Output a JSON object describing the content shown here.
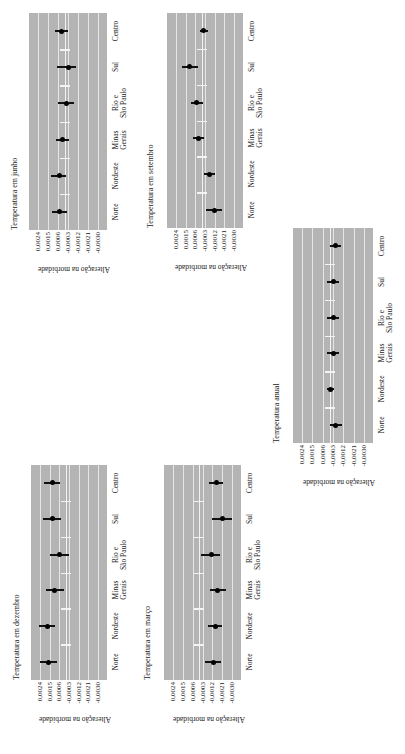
{
  "figure": {
    "categories": [
      "Norte",
      "Nordeste",
      "Minas Gerais",
      "Rio e São Paulo",
      "Sul",
      "Centro"
    ],
    "category_lines": [
      [
        "Norte"
      ],
      [
        "Nordeste"
      ],
      [
        "Minas",
        "Gerais"
      ],
      [
        "Rio e",
        "São Paulo"
      ],
      [
        "Sul"
      ],
      [
        "Centro"
      ]
    ],
    "tick_labels": [
      "0,0024",
      "0,0015",
      "0,0006",
      "-0,0003",
      "-0,0012",
      "-0,0021",
      "-0,0030"
    ],
    "ylabel": "Alteração na morbidade",
    "colors": {
      "plot_bg": "#b4b4b4",
      "grid": "#e6e6e6",
      "marker": "#000000"
    }
  },
  "chart_data": [
    {
      "type": "scatter",
      "title": "Temperatura em junho",
      "xlabel": "",
      "ylabel": "Alteração na morbidade",
      "categories": [
        "Norte",
        "Nordeste",
        "Minas Gerais",
        "Rio e São Paulo",
        "Sul",
        "Centro"
      ],
      "values": [
        0.0005,
        0.0005,
        0.0002,
        -0.0002,
        -0.0003,
        0.0003
      ],
      "ci_low": [
        -0.0002,
        -0.0001,
        -0.0004,
        -0.0008,
        -0.001,
        -0.0003
      ],
      "ci_high": [
        0.0011,
        0.0012,
        0.0008,
        0.0006,
        0.0007,
        0.0009
      ],
      "ylim": [
        -0.003,
        0.0024
      ],
      "grid": true
    },
    {
      "type": "scatter",
      "title": "Temperatura em setembro",
      "xlabel": "",
      "ylabel": "Alteração na morbidade",
      "categories": [
        "Norte",
        "Nordeste",
        "Minas Gerais",
        "Rio e São Paulo",
        "Sul",
        "Centro"
      ],
      "values": [
        -0.0012,
        -0.0007,
        0.0003,
        0.0005,
        0.0011,
        -0.0002
      ],
      "ci_low": [
        -0.0019,
        -0.0012,
        -0.0002,
        -0.0001,
        0.0003,
        -0.0006
      ],
      "ci_high": [
        -0.0004,
        -0.0002,
        0.0008,
        0.001,
        0.0018,
        0.0002
      ],
      "ylim": [
        -0.003,
        0.0024
      ],
      "grid": true
    },
    {
      "type": "scatter",
      "title": "Temperatura em dezembro",
      "xlabel": "",
      "ylabel": "Alteração na morbidade",
      "categories": [
        "Norte",
        "Nordeste",
        "Minas Gerais",
        "Rio e São Paulo",
        "Sul",
        "Centro"
      ],
      "values": [
        0.0016,
        0.0017,
        0.001,
        0.0006,
        0.0012,
        0.0012
      ],
      "ci_low": [
        0.0008,
        0.001,
        0.0002,
        -0.0003,
        0.0004,
        0.0005
      ],
      "ci_high": [
        0.0024,
        0.0025,
        0.0018,
        0.0015,
        0.0021,
        0.002
      ],
      "ylim": [
        -0.003,
        0.0024
      ],
      "grid": true
    },
    {
      "type": "scatter",
      "title": "Temperatura em março",
      "xlabel": "",
      "ylabel": "Alteração na morbidade",
      "categories": [
        "Norte",
        "Nordeste",
        "Minas Gerais",
        "Rio e São Paulo",
        "Sul",
        "Centro"
      ],
      "values": [
        -0.0013,
        -0.0015,
        -0.0017,
        -0.0011,
        -0.0021,
        -0.0016
      ],
      "ci_low": [
        -0.002,
        -0.0021,
        -0.0024,
        -0.0019,
        -0.003,
        -0.0022
      ],
      "ci_high": [
        -0.0005,
        -0.0008,
        -0.001,
        -0.0002,
        -0.0012,
        -0.0009
      ],
      "ylim": [
        -0.003,
        0.0024
      ],
      "grid": true
    },
    {
      "type": "scatter",
      "title": "Temperatura anual",
      "xlabel": "",
      "ylabel": "Alteração na morbidade",
      "categories": [
        "Norte",
        "Nordeste",
        "Minas Gerais",
        "Rio e São Paulo",
        "Sul",
        "Centro"
      ],
      "values": [
        -0.0005,
        -0.0001,
        -0.0003,
        -0.0003,
        -0.0003,
        -0.0005
      ],
      "ci_low": [
        -0.0011,
        -0.0004,
        -0.0008,
        -0.0008,
        -0.0008,
        -0.001
      ],
      "ci_high": [
        0.0,
        0.0002,
        0.0002,
        0.0002,
        0.0002,
        0.0
      ],
      "ylim": [
        -0.003,
        0.0024
      ],
      "grid": true
    }
  ],
  "layout": [
    {
      "plot": [
        29,
        13,
        78,
        217
      ],
      "title_x": 10
    },
    {
      "plot": [
        167,
        13,
        76,
        215
      ],
      "title_x": 146
    },
    {
      "plot": [
        31,
        465,
        76,
        215
      ],
      "title_x": 12
    },
    {
      "plot": [
        164,
        465,
        77,
        215
      ],
      "title_x": 143
    },
    {
      "plot": [
        293,
        228,
        80,
        215
      ],
      "title_x": 272
    }
  ]
}
